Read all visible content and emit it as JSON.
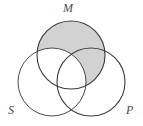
{
  "diagram": {
    "kind": "venn-diagram",
    "title": "",
    "background_color": "#ffffff",
    "outline_color": "#4a4a4a",
    "shade_color": "#d2d2d2",
    "labels": {
      "middle_term": "M",
      "subject_term": "S",
      "predicate_term": "P"
    },
    "circles": [
      {
        "id": "M",
        "label": "M",
        "cx": 71,
        "cy": 55,
        "r": 34,
        "label_x": 63,
        "label_y": 2
      },
      {
        "id": "S",
        "label": "S",
        "cx": 52,
        "cy": 82,
        "r": 34,
        "label_x": 8,
        "label_y": 104
      },
      {
        "id": "P",
        "label": "P",
        "cx": 91,
        "cy": 82,
        "r": 34,
        "label_x": 126,
        "label_y": 104
      }
    ],
    "shaded_regions": [
      {
        "id": "M-only",
        "description": "M outside S and outside P",
        "shaded": true
      },
      {
        "id": "M-and-P-not-S",
        "description": "M intersect P, excluding S",
        "shaded": true
      },
      {
        "id": "M-and-S-not-P",
        "description": "M intersect S, excluding P",
        "shaded": false
      },
      {
        "id": "M-and-S-and-P",
        "description": "triple intersection M, S and P",
        "shaded": false
      },
      {
        "id": "S-only",
        "description": "S outside M and outside P",
        "shaded": false
      },
      {
        "id": "P-only",
        "description": "P outside M and outside S",
        "shaded": false
      },
      {
        "id": "S-and-P-not-M",
        "description": "S intersect P, excluding M",
        "shaded": false
      }
    ]
  }
}
